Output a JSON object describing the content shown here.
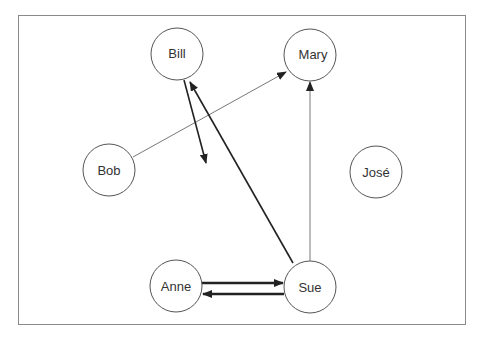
{
  "diagram": {
    "type": "sociogram",
    "nodes": [
      {
        "id": "bill",
        "label": "Bill",
        "cx": 177,
        "cy": 54
      },
      {
        "id": "mary",
        "label": "Mary",
        "cx": 310,
        "cy": 55
      },
      {
        "id": "bob",
        "label": "Bob",
        "cx": 109,
        "cy": 170
      },
      {
        "id": "jose",
        "label": "José",
        "cx": 376,
        "cy": 172
      },
      {
        "id": "anne",
        "label": "Anne",
        "cx": 176,
        "cy": 286
      },
      {
        "id": "sue",
        "label": "Sue",
        "cx": 310,
        "cy": 287
      }
    ],
    "edges": [
      {
        "from": "Bob",
        "to": "Mary",
        "weight": "thin"
      },
      {
        "from": "Sue",
        "to": "Mary",
        "weight": "thin"
      },
      {
        "from": "Sue",
        "to": "Bill",
        "weight": "medium"
      },
      {
        "from": "Bill",
        "to": "(open)",
        "weight": "medium"
      },
      {
        "from": "Anne",
        "to": "Sue",
        "weight": "thick"
      },
      {
        "from": "Sue",
        "to": "Anne",
        "weight": "thick"
      }
    ]
  }
}
